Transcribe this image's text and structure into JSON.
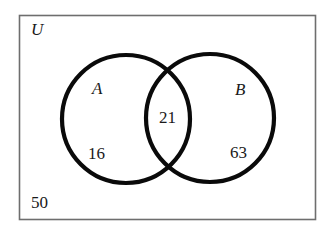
{
  "diagram": {
    "type": "venn",
    "universe": {
      "label": "U",
      "outside_value": "50",
      "rect": {
        "x": 19,
        "y": 15,
        "width": 296,
        "height": 204
      },
      "border_color": "#6e6e6e"
    },
    "sets": [
      {
        "label": "A",
        "only_value": "16",
        "circle": {
          "cx": 126,
          "cy": 119,
          "r": 66
        }
      },
      {
        "label": "B",
        "only_value": "63",
        "circle": {
          "cx": 210,
          "cy": 118,
          "r": 66
        }
      }
    ],
    "intersection": {
      "sets": [
        "A",
        "B"
      ],
      "value": "21"
    },
    "circle_stroke_color": "#0a0a0a",
    "circle_stroke_width": 4
  }
}
